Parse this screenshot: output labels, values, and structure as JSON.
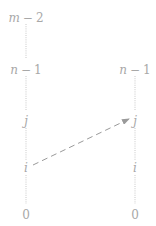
{
  "diagram": {
    "left_column": {
      "labels": [
        {
          "var": "m",
          "op": "−",
          "num": "2"
        },
        {
          "var": "n",
          "op": "−",
          "num": "1"
        },
        {
          "var": "j"
        },
        {
          "var": "i"
        },
        {
          "num": "0"
        }
      ]
    },
    "right_column": {
      "labels": [
        {
          "var": "n",
          "op": "−",
          "num": "1"
        },
        {
          "var": "j"
        },
        {
          "var": "i"
        },
        {
          "num": "0"
        }
      ]
    },
    "arrow": {
      "from": "left i",
      "to": "right j",
      "style": "dashed"
    },
    "colors": {
      "text": "#a8a8a8",
      "line": "#c8c8c8",
      "arrow": "#9a9a9a"
    }
  }
}
